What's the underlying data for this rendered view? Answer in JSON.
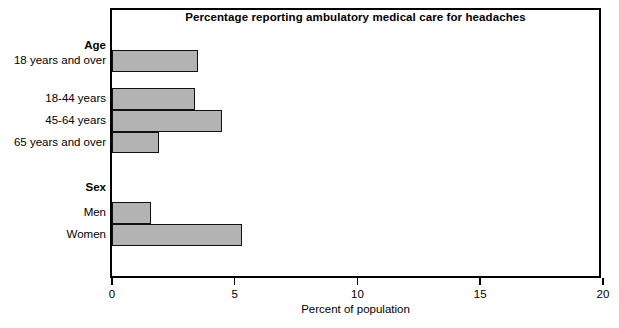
{
  "chart_data": {
    "type": "bar",
    "orientation": "horizontal",
    "title": "Percentage reporting ambulatory medical care for headaches",
    "xlabel": "Percent of population",
    "ylabel": "",
    "xlim": [
      0,
      20
    ],
    "xticks": [
      0,
      5,
      10,
      15,
      20
    ],
    "xticklabels": [
      "0",
      "5",
      "10",
      "15",
      "20"
    ],
    "grid": false,
    "legend": false,
    "bar_color": "#b3b3b3",
    "bar_edge_color": "#111111",
    "groups": [
      {
        "name": "Age",
        "categories": [
          "18 years and over",
          "18-44 years",
          "45-64 years",
          "65 years and over"
        ],
        "values": [
          3.5,
          3.4,
          4.5,
          1.9
        ]
      },
      {
        "name": "Sex",
        "categories": [
          "Men",
          "Women"
        ],
        "values": [
          1.6,
          5.3
        ]
      }
    ],
    "categories": [
      "18 years and over",
      "18-44 years",
      "45-64 years",
      "65 years and over",
      "Men",
      "Women"
    ],
    "values": [
      3.5,
      3.4,
      4.5,
      1.9,
      1.6,
      5.3
    ]
  },
  "rows": [
    {
      "kind": "group",
      "label": "Age",
      "value": null,
      "top": 28,
      "height": 16
    },
    {
      "kind": "bar",
      "label": "18 years and over",
      "value": 3.5,
      "top": 40,
      "height": 22
    },
    {
      "kind": "spacer",
      "label": "",
      "value": null,
      "top": 62,
      "height": 16
    },
    {
      "kind": "bar",
      "label": "18-44 years",
      "value": 3.4,
      "top": 78,
      "height": 22
    },
    {
      "kind": "bar",
      "label": "45-64 years",
      "value": 4.5,
      "top": 100,
      "height": 22
    },
    {
      "kind": "bar",
      "label": "65 years and over",
      "value": 1.9,
      "top": 122,
      "height": 21
    },
    {
      "kind": "group",
      "label": "Sex",
      "value": null,
      "top": 170,
      "height": 16
    },
    {
      "kind": "bar",
      "label": "Men",
      "value": 1.6,
      "top": 192,
      "height": 22
    },
    {
      "kind": "bar",
      "label": "Women",
      "value": 5.3,
      "top": 214,
      "height": 22
    }
  ]
}
